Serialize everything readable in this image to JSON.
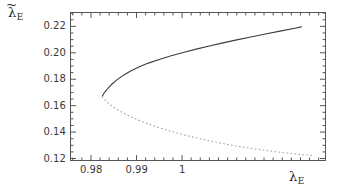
{
  "figure": {
    "background_color": "#ffffff",
    "frame_color": "#555555",
    "y_axis_label": "λ",
    "y_axis_label_sub": "E",
    "y_axis_label_accent": "~",
    "x_axis_label": "λ",
    "x_axis_label_sub": "E"
  },
  "chart_data": {
    "type": "line",
    "title": "",
    "subtitle": "",
    "xlabel": "λ_E",
    "ylabel": "λ̃_E",
    "xlim": [
      0.9755,
      1.0315
    ],
    "ylim": [
      0.1185,
      0.2305
    ],
    "xticks": [
      0.98,
      0.99,
      1.0
    ],
    "xticklabels": [
      "0.98",
      "0.99",
      "1"
    ],
    "yticks": [
      0.12,
      0.14,
      0.16,
      0.18,
      0.2,
      0.22
    ],
    "yticklabels": [
      "0.12",
      "0.14",
      "0.16",
      "0.18",
      "0.20",
      "0.22"
    ],
    "x_minor_step": 0.002,
    "y_minor_step": 0.005,
    "grid": false,
    "legend": null,
    "legend_position": "none",
    "annotations": [],
    "series": [
      {
        "name": "upper branch (stable)",
        "style": "solid",
        "color": "#3c3c3c",
        "width": 1.1,
        "x": [
          0.9825,
          0.9827,
          0.9831,
          0.9837,
          0.9845,
          0.9856,
          0.987,
          0.9886,
          0.9905,
          0.9926,
          0.995,
          0.9976,
          1.0003,
          1.0031,
          1.006,
          1.009,
          1.012,
          1.0151,
          1.0183,
          1.0215,
          1.0248,
          1.0262
        ],
        "y": [
          0.1672,
          0.1686,
          0.1705,
          0.173,
          0.176,
          0.1793,
          0.1827,
          0.186,
          0.1892,
          0.1922,
          0.195,
          0.1977,
          0.2003,
          0.2028,
          0.2052,
          0.2075,
          0.2098,
          0.212,
          0.2142,
          0.2164,
          0.2186,
          0.2196
        ]
      },
      {
        "name": "lower branch (unstable)",
        "style": "dotted",
        "color": "#a8a8a8",
        "width": 1.1,
        "x": [
          0.9825,
          0.9828,
          0.9834,
          0.9843,
          0.9855,
          0.987,
          0.9888,
          0.9909,
          0.9933,
          0.996,
          0.999,
          1.0022,
          1.0056,
          1.009,
          1.0124,
          1.0157,
          1.0188,
          1.0216,
          1.024,
          1.026,
          1.0276,
          1.029
        ],
        "y": [
          0.1668,
          0.1652,
          0.163,
          0.1604,
          0.1576,
          0.1546,
          0.1515,
          0.1484,
          0.1453,
          0.1422,
          0.1392,
          0.1364,
          0.1337,
          0.1313,
          0.1292,
          0.1274,
          0.1259,
          0.1247,
          0.1238,
          0.1231,
          0.1226,
          0.1221
        ]
      }
    ],
    "fold_point": {
      "x": 0.9825,
      "y": 0.167
    }
  }
}
